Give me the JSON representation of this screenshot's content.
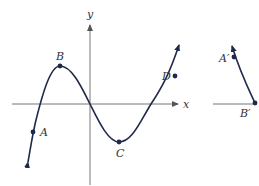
{
  "colors": {
    "curve": "#1f2a4a",
    "axis": "#777777",
    "label": "#333333",
    "background": "#ffffff"
  },
  "axes": {
    "x_label": "x",
    "y_label": "y"
  },
  "points": {
    "A": "A",
    "B": "B",
    "C": "C",
    "D": "D"
  },
  "derivative_panel": {
    "A_prime": "A′",
    "B_prime": "B′"
  }
}
